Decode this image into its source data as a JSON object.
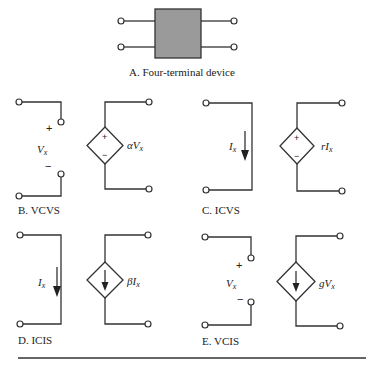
{
  "panels": {
    "A": {
      "caption": "A.  Four-terminal device",
      "box_fill": "#9a9a9a"
    },
    "B": {
      "caption": "B.  VCVS",
      "control": {
        "type": "voltage",
        "label": "Vx",
        "plus": "+",
        "minus": "−"
      },
      "source": {
        "shape": "diamond",
        "inner": "polarity",
        "plus": "+",
        "minus": "−",
        "label": "αVx"
      }
    },
    "C": {
      "caption": "C.  ICVS",
      "control": {
        "type": "current",
        "label": "Ix"
      },
      "source": {
        "shape": "diamond",
        "inner": "polarity",
        "plus": "+",
        "minus": "−",
        "label": "rIx"
      }
    },
    "D": {
      "caption": "D.  ICIS",
      "control": {
        "type": "current",
        "label": "Ix"
      },
      "source": {
        "shape": "diamond",
        "inner": "arrow-down",
        "label": "βIx"
      }
    },
    "E": {
      "caption": "E.  VCIS",
      "control": {
        "type": "voltage",
        "label": "Vx",
        "plus": "+",
        "minus": "−"
      },
      "source": {
        "shape": "diamond",
        "inner": "arrow-down",
        "label": "gVx"
      }
    }
  },
  "labels": {
    "B_ctrl": "V",
    "B_ctrl_sub": "x",
    "B_src_pre": "αV",
    "B_src_sub": "x",
    "C_ctrl": "I",
    "C_ctrl_sub": "x",
    "C_src_pre": "rI",
    "C_src_sub": "x",
    "D_ctrl": "I",
    "D_ctrl_sub": "x",
    "D_src_pre": "βI",
    "D_src_sub": "x",
    "E_ctrl": "V",
    "E_ctrl_sub": "x",
    "E_src_pre": "gV",
    "E_src_sub": "x",
    "plus": "+",
    "minus": "−"
  }
}
